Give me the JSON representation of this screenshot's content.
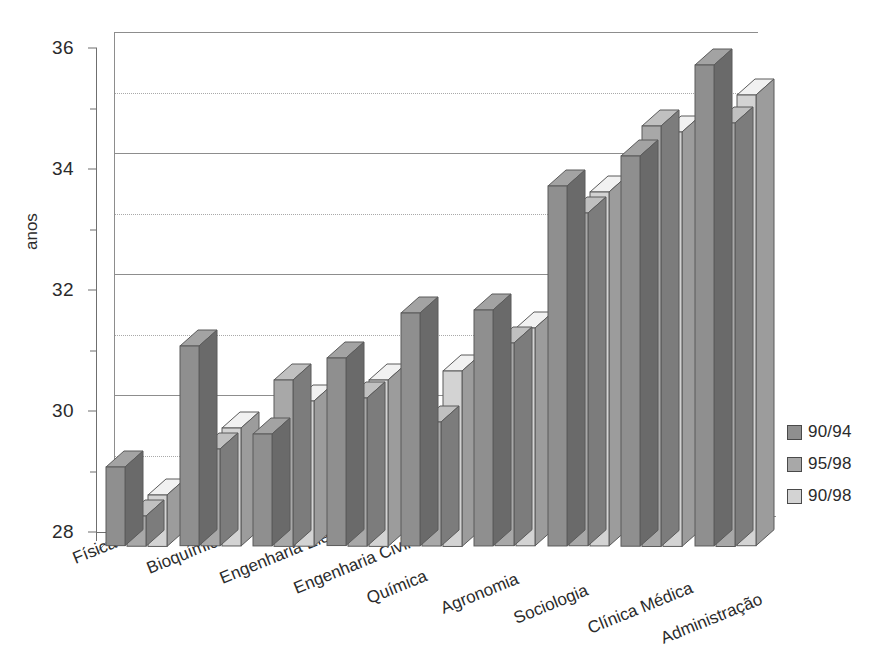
{
  "chart_data": {
    "type": "bar",
    "title": "",
    "subtitle": "",
    "xlabel": "",
    "ylabel": "anos",
    "ylim": [
      28,
      36
    ],
    "yticks": [
      28,
      30,
      32,
      34,
      36
    ],
    "yticks_minor": [
      29,
      31,
      33,
      35
    ],
    "grid": "horizontal major solid, minor dotted",
    "legend_position": "right",
    "style": "3d-clustered-column",
    "categories": [
      "Física",
      "Bioquímica",
      "Engenharia Elétrica",
      "Engenharia Civil",
      "Química",
      "Agronomia",
      "Sociologia",
      "Clínica Médica",
      "Administração"
    ],
    "series": [
      {
        "name": "90/94",
        "color": "#8f8f8f",
        "values": [
          29.3,
          31.3,
          29.85,
          31.1,
          31.85,
          31.9,
          33.95,
          34.45,
          35.95
        ]
      },
      {
        "name": "95/98",
        "color": "#a8a8a8",
        "values": [
          28.5,
          29.6,
          30.75,
          30.45,
          30.05,
          31.35,
          33.5,
          34.95,
          35.0
        ]
      },
      {
        "name": "90/98",
        "color": "#d3d3d3",
        "values": [
          28.85,
          29.95,
          30.4,
          30.75,
          30.9,
          31.6,
          33.85,
          34.85,
          35.45
        ]
      }
    ]
  },
  "axis": {
    "y_title": "anos",
    "y_tick_labels": [
      "28",
      "30",
      "32",
      "34",
      "36"
    ]
  },
  "legend": {
    "items": [
      {
        "label": "90/94",
        "color": "#8f8f8f"
      },
      {
        "label": "95/98",
        "color": "#a8a8a8"
      },
      {
        "label": "90/98",
        "color": "#d3d3d3"
      }
    ]
  }
}
